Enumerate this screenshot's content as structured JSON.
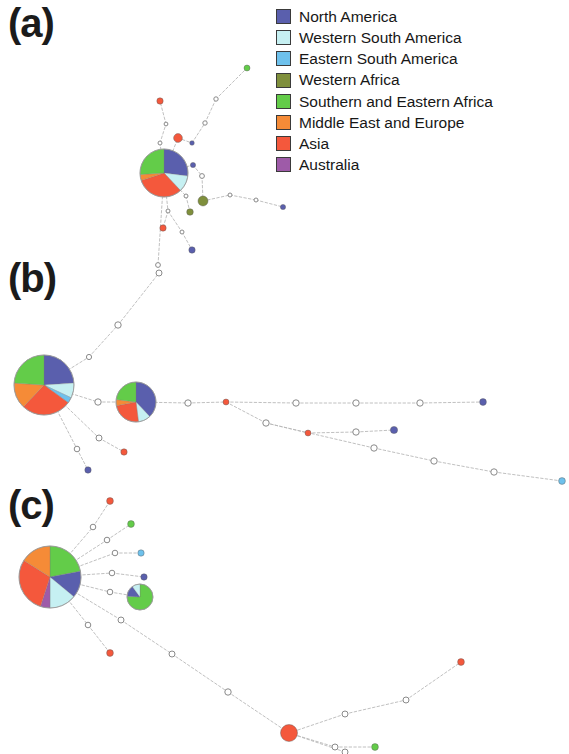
{
  "figure": {
    "type": "haplotype-network",
    "width": 569,
    "height": 754,
    "background": "#ffffff"
  },
  "panels": [
    {
      "id": "a",
      "label": "(a)"
    },
    {
      "id": "b",
      "label": "(b)"
    },
    {
      "id": "c",
      "label": "(c)"
    }
  ],
  "legend": {
    "title": "",
    "items": [
      {
        "label": "North America",
        "color": "#5a5fad"
      },
      {
        "label": "Western South America",
        "color": "#c6f0f2"
      },
      {
        "label": "Eastern South America",
        "color": "#6ec1ec"
      },
      {
        "label": "Western Africa",
        "color": "#7f8f3c"
      },
      {
        "label": "Southern and Eastern Africa",
        "color": "#63cc49"
      },
      {
        "label": "Middle East and Europe",
        "color": "#f58b37"
      },
      {
        "label": "Asia",
        "color": "#f4583c"
      },
      {
        "label": "Australia",
        "color": "#9e5ba8"
      }
    ]
  },
  "chart_data": {
    "type": "network",
    "title": "",
    "xlabel": "",
    "ylabel": "",
    "region_colors": {
      "north_america": "#5a5fad",
      "western_south_america": "#c6f0f2",
      "eastern_south_america": "#6ec1ec",
      "western_africa": "#7f8f3c",
      "southern_eastern_africa": "#63cc49",
      "middle_east_europe": "#f58b37",
      "asia": "#f4583c",
      "australia": "#9e5ba8"
    },
    "edge_color": "#b9b9b9",
    "node_outline": "#8a8a8a",
    "networks": [
      {
        "panel": "a",
        "nodes": [
          {
            "id": "a-hub",
            "x": 164,
            "y": 173,
            "r": 24,
            "kind": "pie",
            "slices": [
              {
                "region": "north_america",
                "frac": 0.27
              },
              {
                "region": "western_south_america",
                "frac": 0.11
              },
              {
                "region": "asia",
                "frac": 0.32
              },
              {
                "region": "middle_east_europe",
                "frac": 0.04
              },
              {
                "region": "southern_eastern_africa",
                "frac": 0.26
              }
            ]
          },
          {
            "id": "a-n1",
            "x": 160,
            "y": 101,
            "r": 3.2,
            "kind": "solid",
            "region": "asia"
          },
          {
            "id": "a-n2",
            "x": 166,
            "y": 124,
            "r": 1.9,
            "kind": "hollow"
          },
          {
            "id": "a-n3",
            "x": 178,
            "y": 138,
            "r": 4.4,
            "kind": "solid",
            "region": "asia"
          },
          {
            "id": "a-n4",
            "x": 160,
            "y": 143,
            "r": 2.0,
            "kind": "hollow"
          },
          {
            "id": "a-n5",
            "x": 192,
            "y": 143,
            "r": 2.3,
            "kind": "solid",
            "region": "north_america"
          },
          {
            "id": "a-n6",
            "x": 205,
            "y": 123,
            "r": 2.2,
            "kind": "hollow"
          },
          {
            "id": "a-n7",
            "x": 216,
            "y": 99,
            "r": 2.2,
            "kind": "hollow"
          },
          {
            "id": "a-n8",
            "x": 247,
            "y": 68,
            "r": 3.0,
            "kind": "solid",
            "region": "southern_eastern_africa"
          },
          {
            "id": "a-n9",
            "x": 193,
            "y": 165,
            "r": 2.6,
            "kind": "solid",
            "region": "north_america"
          },
          {
            "id": "a-n10",
            "x": 202,
            "y": 176,
            "r": 2.4,
            "kind": "hollow"
          },
          {
            "id": "a-n11",
            "x": 203,
            "y": 201,
            "r": 5.0,
            "kind": "solid",
            "region": "western_africa"
          },
          {
            "id": "a-n12",
            "x": 186,
            "y": 196,
            "r": 2.0,
            "kind": "hollow"
          },
          {
            "id": "a-n13",
            "x": 190,
            "y": 212,
            "r": 3.3,
            "kind": "solid",
            "region": "western_africa"
          },
          {
            "id": "a-n14",
            "x": 230,
            "y": 195,
            "r": 2.0,
            "kind": "hollow"
          },
          {
            "id": "a-n15",
            "x": 256,
            "y": 200,
            "r": 2.0,
            "kind": "hollow"
          },
          {
            "id": "a-n16",
            "x": 283,
            "y": 207,
            "r": 2.6,
            "kind": "solid",
            "region": "north_america"
          },
          {
            "id": "a-n17",
            "x": 168,
            "y": 211,
            "r": 2.0,
            "kind": "hollow"
          },
          {
            "id": "a-n18",
            "x": 163,
            "y": 228,
            "r": 3.2,
            "kind": "solid",
            "region": "asia"
          },
          {
            "id": "a-n19",
            "x": 182,
            "y": 232,
            "r": 2.0,
            "kind": "hollow"
          },
          {
            "id": "a-n20",
            "x": 192,
            "y": 250,
            "r": 3.2,
            "kind": "solid",
            "region": "north_america"
          },
          {
            "id": "a-n21",
            "x": 158,
            "y": 265,
            "r": 2.4,
            "kind": "hollow"
          }
        ],
        "edges": [
          [
            "a-hub",
            "a-n4"
          ],
          [
            "a-n4",
            "a-n2"
          ],
          [
            "a-n2",
            "a-n1"
          ],
          [
            "a-hub",
            "a-n3"
          ],
          [
            "a-n3",
            "a-n5"
          ],
          [
            "a-n5",
            "a-n6"
          ],
          [
            "a-n6",
            "a-n7"
          ],
          [
            "a-n7",
            "a-n8"
          ],
          [
            "a-hub",
            "a-n9"
          ],
          [
            "a-n9",
            "a-n10"
          ],
          [
            "a-n10",
            "a-n11"
          ],
          [
            "a-hub",
            "a-n12"
          ],
          [
            "a-n12",
            "a-n13"
          ],
          [
            "a-n11",
            "a-n14"
          ],
          [
            "a-n14",
            "a-n15"
          ],
          [
            "a-n15",
            "a-n16"
          ],
          [
            "a-hub",
            "a-n17"
          ],
          [
            "a-n17",
            "a-n18"
          ],
          [
            "a-n17",
            "a-n19"
          ],
          [
            "a-n19",
            "a-n20"
          ],
          [
            "a-hub",
            "a-n21"
          ]
        ]
      },
      {
        "panel": "b",
        "nodes": [
          {
            "id": "b-hub",
            "x": 44,
            "y": 385,
            "r": 30,
            "kind": "pie",
            "slices": [
              {
                "region": "north_america",
                "frac": 0.24
              },
              {
                "region": "western_south_america",
                "frac": 0.08
              },
              {
                "region": "eastern_south_america",
                "frac": 0.03
              },
              {
                "region": "asia",
                "frac": 0.27
              },
              {
                "region": "middle_east_europe",
                "frac": 0.14
              },
              {
                "region": "southern_eastern_africa",
                "frac": 0.24
              }
            ]
          },
          {
            "id": "b-hub2",
            "x": 136,
            "y": 402,
            "r": 20,
            "kind": "pie",
            "slices": [
              {
                "region": "north_america",
                "frac": 0.38
              },
              {
                "region": "western_south_america",
                "frac": 0.1
              },
              {
                "region": "asia",
                "frac": 0.24
              },
              {
                "region": "middle_east_europe",
                "frac": 0.05
              },
              {
                "region": "southern_eastern_africa",
                "frac": 0.23
              }
            ]
          },
          {
            "id": "b-m1",
            "x": 98,
            "y": 402,
            "r": 3.2,
            "kind": "hollow"
          },
          {
            "id": "b-u1",
            "x": 89,
            "y": 357,
            "r": 2.6,
            "kind": "hollow"
          },
          {
            "id": "b-u2",
            "x": 118,
            "y": 325,
            "r": 3.2,
            "kind": "hollow"
          },
          {
            "id": "b-u3",
            "x": 159,
            "y": 273,
            "r": 3.0,
            "kind": "hollow"
          },
          {
            "id": "b-d1",
            "x": 99,
            "y": 438,
            "r": 3.0,
            "kind": "hollow"
          },
          {
            "id": "b-d2",
            "x": 124,
            "y": 452,
            "r": 3.2,
            "kind": "solid",
            "region": "asia"
          },
          {
            "id": "b-d3",
            "x": 77,
            "y": 449,
            "r": 2.8,
            "kind": "hollow"
          },
          {
            "id": "b-d4",
            "x": 88,
            "y": 470,
            "r": 3.2,
            "kind": "solid",
            "region": "north_america"
          },
          {
            "id": "b-c1",
            "x": 188,
            "y": 403,
            "r": 3.2,
            "kind": "hollow"
          },
          {
            "id": "b-c2",
            "x": 226,
            "y": 402,
            "r": 3.0,
            "kind": "solid",
            "region": "asia"
          },
          {
            "id": "b-c3",
            "x": 296,
            "y": 403,
            "r": 3.2,
            "kind": "hollow"
          },
          {
            "id": "b-c4",
            "x": 356,
            "y": 403,
            "r": 3.2,
            "kind": "hollow"
          },
          {
            "id": "b-c5",
            "x": 420,
            "y": 403,
            "r": 3.2,
            "kind": "hollow"
          },
          {
            "id": "b-c6",
            "x": 483,
            "y": 402,
            "r": 3.4,
            "kind": "solid",
            "region": "north_america"
          },
          {
            "id": "b-b1",
            "x": 266,
            "y": 423,
            "r": 3.2,
            "kind": "hollow"
          },
          {
            "id": "b-b2",
            "x": 308,
            "y": 433,
            "r": 3.0,
            "kind": "solid",
            "region": "asia"
          },
          {
            "id": "b-b3",
            "x": 356,
            "y": 432,
            "r": 3.2,
            "kind": "hollow"
          },
          {
            "id": "b-b4",
            "x": 394,
            "y": 430,
            "r": 3.6,
            "kind": "solid",
            "region": "north_america"
          },
          {
            "id": "b-e1",
            "x": 374,
            "y": 448,
            "r": 3.2,
            "kind": "hollow"
          },
          {
            "id": "b-e2",
            "x": 434,
            "y": 461,
            "r": 3.2,
            "kind": "hollow"
          },
          {
            "id": "b-e3",
            "x": 494,
            "y": 472,
            "r": 3.2,
            "kind": "hollow"
          },
          {
            "id": "b-e4",
            "x": 562,
            "y": 481,
            "r": 3.4,
            "kind": "solid",
            "region": "eastern_south_america"
          }
        ],
        "edges": [
          [
            "b-hub",
            "b-m1"
          ],
          [
            "b-m1",
            "b-hub2"
          ],
          [
            "b-hub",
            "b-u1"
          ],
          [
            "b-u1",
            "b-u2"
          ],
          [
            "b-u2",
            "b-u3"
          ],
          [
            "b-hub",
            "b-d3"
          ],
          [
            "b-d3",
            "b-d4"
          ],
          [
            "b-hub",
            "b-d1"
          ],
          [
            "b-d1",
            "b-d2"
          ],
          [
            "b-hub2",
            "b-c1"
          ],
          [
            "b-c1",
            "b-c2"
          ],
          [
            "b-c2",
            "b-c3"
          ],
          [
            "b-c3",
            "b-c4"
          ],
          [
            "b-c4",
            "b-c5"
          ],
          [
            "b-c5",
            "b-c6"
          ],
          [
            "b-c2",
            "b-b1"
          ],
          [
            "b-b1",
            "b-b2"
          ],
          [
            "b-b2",
            "b-b3"
          ],
          [
            "b-b3",
            "b-b4"
          ],
          [
            "b-b1",
            "b-e1"
          ],
          [
            "b-e1",
            "b-e2"
          ],
          [
            "b-e2",
            "b-e3"
          ],
          [
            "b-e3",
            "b-e4"
          ]
        ]
      },
      {
        "panel": "c",
        "nodes": [
          {
            "id": "c-hub",
            "x": 50,
            "y": 577,
            "r": 31,
            "kind": "pie",
            "slices": [
              {
                "region": "southern_eastern_africa",
                "frac": 0.22
              },
              {
                "region": "north_america",
                "frac": 0.14
              },
              {
                "region": "western_south_america",
                "frac": 0.14
              },
              {
                "region": "australia",
                "frac": 0.05
              },
              {
                "region": "asia",
                "frac": 0.29
              },
              {
                "region": "middle_east_europe",
                "frac": 0.16
              }
            ]
          },
          {
            "id": "c-p2",
            "x": 140,
            "y": 597,
            "r": 13,
            "kind": "pie",
            "slices": [
              {
                "region": "southern_eastern_africa",
                "frac": 0.76
              },
              {
                "region": "north_america",
                "frac": 0.14
              },
              {
                "region": "western_south_america",
                "frac": 0.1
              }
            ]
          },
          {
            "id": "c-s1",
            "x": 93,
            "y": 527,
            "r": 2.8,
            "kind": "hollow"
          },
          {
            "id": "c-t1",
            "x": 110,
            "y": 501,
            "r": 3.4,
            "kind": "solid",
            "region": "asia"
          },
          {
            "id": "c-s2",
            "x": 107,
            "y": 540,
            "r": 2.8,
            "kind": "hollow"
          },
          {
            "id": "c-t2",
            "x": 131,
            "y": 524,
            "r": 3.4,
            "kind": "solid",
            "region": "southern_eastern_africa"
          },
          {
            "id": "c-s3",
            "x": 115,
            "y": 553,
            "r": 2.8,
            "kind": "hollow"
          },
          {
            "id": "c-t3",
            "x": 141,
            "y": 553,
            "r": 3.2,
            "kind": "solid",
            "region": "eastern_south_america"
          },
          {
            "id": "c-s4",
            "x": 112,
            "y": 573,
            "r": 2.8,
            "kind": "hollow"
          },
          {
            "id": "c-t4",
            "x": 144,
            "y": 577,
            "r": 3.2,
            "kind": "solid",
            "region": "north_america"
          },
          {
            "id": "c-s5",
            "x": 110,
            "y": 592,
            "r": 2.8,
            "kind": "hollow"
          },
          {
            "id": "c-s6",
            "x": 121,
            "y": 620,
            "r": 3.0,
            "kind": "hollow"
          },
          {
            "id": "c-s7",
            "x": 88,
            "y": 625,
            "r": 2.8,
            "kind": "hollow"
          },
          {
            "id": "c-t5",
            "x": 110,
            "y": 653,
            "r": 3.4,
            "kind": "solid",
            "region": "asia"
          },
          {
            "id": "c-l1",
            "x": 172,
            "y": 654,
            "r": 3.0,
            "kind": "hollow"
          },
          {
            "id": "c-l2",
            "x": 228,
            "y": 692,
            "r": 3.2,
            "kind": "hollow"
          },
          {
            "id": "c-big",
            "x": 289,
            "y": 733,
            "r": 8.5,
            "kind": "solid",
            "region": "asia"
          },
          {
            "id": "c-r1",
            "x": 345,
            "y": 714,
            "r": 3.0,
            "kind": "hollow"
          },
          {
            "id": "c-r2",
            "x": 406,
            "y": 700,
            "r": 3.0,
            "kind": "hollow"
          },
          {
            "id": "c-r3",
            "x": 461,
            "y": 662,
            "r": 3.4,
            "kind": "solid",
            "region": "asia"
          },
          {
            "id": "c-m1",
            "x": 335,
            "y": 747,
            "r": 3.0,
            "kind": "hollow"
          },
          {
            "id": "c-m2",
            "x": 375,
            "y": 747,
            "r": 3.4,
            "kind": "solid",
            "region": "southern_eastern_africa"
          },
          {
            "id": "c-b1",
            "x": 345,
            "y": 752,
            "r": 3.0,
            "kind": "hollow"
          }
        ],
        "edges": [
          [
            "c-hub",
            "c-s1"
          ],
          [
            "c-s1",
            "c-t1"
          ],
          [
            "c-hub",
            "c-s2"
          ],
          [
            "c-s2",
            "c-t2"
          ],
          [
            "c-hub",
            "c-s3"
          ],
          [
            "c-s3",
            "c-t3"
          ],
          [
            "c-hub",
            "c-s4"
          ],
          [
            "c-s4",
            "c-t4"
          ],
          [
            "c-hub",
            "c-s5"
          ],
          [
            "c-s5",
            "c-p2"
          ],
          [
            "c-hub",
            "c-s7"
          ],
          [
            "c-s7",
            "c-t5"
          ],
          [
            "c-hub",
            "c-s6"
          ],
          [
            "c-s6",
            "c-l1"
          ],
          [
            "c-l1",
            "c-l2"
          ],
          [
            "c-l2",
            "c-big"
          ],
          [
            "c-big",
            "c-r1"
          ],
          [
            "c-r1",
            "c-r2"
          ],
          [
            "c-r2",
            "c-r3"
          ],
          [
            "c-big",
            "c-m1"
          ],
          [
            "c-m1",
            "c-m2"
          ],
          [
            "c-big",
            "c-b1"
          ]
        ]
      }
    ]
  }
}
